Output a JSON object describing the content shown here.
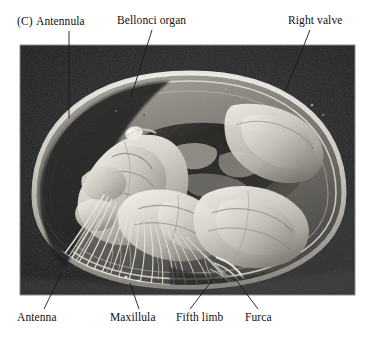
{
  "figure": {
    "panel_letter": "(C)",
    "photo": {
      "kind": "sem-micrograph",
      "subject": "ostracod dissected specimen, left lateral view inside right valve",
      "background_color": "#1b1b1b",
      "specimen_highlight_color": "#e6e4df",
      "midtone_color": "#8e8c87",
      "frame_color": "#8a8a8a",
      "left": 20,
      "top": 45,
      "width": 335,
      "height": 250
    },
    "annotations": [
      {
        "id": "antennula",
        "label": "Antennula",
        "position": "top",
        "text_x": 33,
        "text_y": 21,
        "leader": {
          "x1": 69,
          "y1": 31,
          "x2": 69,
          "y2": 118
        },
        "leader_style": "dark-on-light"
      },
      {
        "id": "bellonci-organ",
        "label": "Bellonci organ",
        "position": "top",
        "text_x": 117,
        "text_y": 20,
        "leader": {
          "x1": 152,
          "y1": 30,
          "x2": 131,
          "y2": 97
        },
        "leader_style": "dark-on-light"
      },
      {
        "id": "right-valve",
        "label": "Right valve",
        "position": "top",
        "text_x": 288,
        "text_y": 20,
        "leader": {
          "x1": 310,
          "y1": 30,
          "x2": 286,
          "y2": 90
        },
        "leader_style": "dark-on-light"
      },
      {
        "id": "antenna",
        "label": "Antenna",
        "position": "bottom",
        "text_x": 17,
        "text_y": 313,
        "leader": {
          "x1": 44,
          "y1": 309,
          "x2": 62,
          "y2": 272
        },
        "leader_style": "dark-on-light"
      },
      {
        "id": "maxillula",
        "label": "Maxillula",
        "position": "bottom",
        "text_x": 110,
        "text_y": 313,
        "leader": {
          "x1": 139,
          "y1": 309,
          "x2": 130,
          "y2": 283
        },
        "leader_style": "dark-on-light"
      },
      {
        "id": "fifth-limb",
        "label": "Fifth limb",
        "position": "bottom",
        "text_x": 176,
        "text_y": 313,
        "leader": {
          "x1": 190,
          "y1": 309,
          "x2": 214,
          "y2": 278
        },
        "leader_style": "dark-on-light"
      },
      {
        "id": "furca",
        "label": "Furca",
        "position": "bottom",
        "text_x": 245,
        "text_y": 313,
        "leader": {
          "x1": 258,
          "y1": 309,
          "x2": 237,
          "y2": 281
        },
        "leader_style": "dark-on-light"
      }
    ]
  }
}
